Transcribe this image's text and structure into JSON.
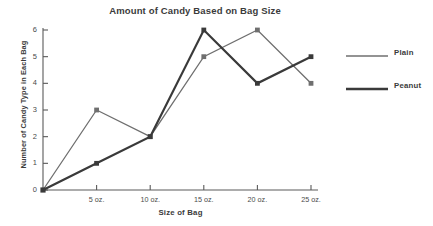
{
  "chart_data": {
    "type": "line",
    "title": "Amount of Candy Based on Bag Size",
    "xlabel": "Size of Bag",
    "ylabel": "Number of Candy Type in Each Bag",
    "categories": [
      "0",
      "5 oz.",
      "10 oz.",
      "15 oz.",
      "20 oz.",
      "25 oz."
    ],
    "x_tick_labels": [
      "5 oz.",
      "10 oz.",
      "15 oz.",
      "20 oz.",
      "25 oz."
    ],
    "y_tick_labels": [
      "0",
      "1",
      "2",
      "3",
      "4",
      "5",
      "6"
    ],
    "xlim": [
      0,
      25
    ],
    "ylim": [
      0,
      6
    ],
    "grid": false,
    "legend_position": "right",
    "series": [
      {
        "name": "Plain",
        "color": "#6f6f6f",
        "line_width": 1.3,
        "marker": "square",
        "x": [
          0,
          5,
          10,
          15,
          20,
          25
        ],
        "values": [
          0,
          3,
          2,
          5,
          6,
          4
        ]
      },
      {
        "name": "Peanut",
        "color": "#3a3a3a",
        "line_width": 2.2,
        "marker": "square",
        "x": [
          0,
          5,
          10,
          15,
          20,
          25
        ],
        "values": [
          0,
          1,
          2,
          6,
          4,
          5
        ]
      }
    ]
  },
  "legend": {
    "items": [
      {
        "label": "Plain"
      },
      {
        "label": "Peanut"
      }
    ]
  },
  "colors": {
    "background": "#ffffff",
    "axis": "#5a5a5a",
    "text": "#3b3b3b",
    "plain": "#6f6f6f",
    "peanut": "#3a3a3a"
  }
}
